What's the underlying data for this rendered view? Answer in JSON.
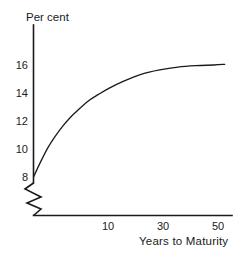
{
  "chart_data": {
    "type": "line",
    "title": "",
    "subtitle": "",
    "xlabel": "Years to Maturity",
    "ylabel": "Per cent",
    "xlim": [
      0,
      55
    ],
    "ylim": [
      7.2,
      17.2
    ],
    "grid": false,
    "legend": null,
    "axis_break": {
      "present": true,
      "axis": "y",
      "note": "zigzag break at origin indicating suppressed zero"
    },
    "xticks": [
      10,
      30,
      50
    ],
    "xtick_labels": [
      "10",
      "30",
      "50"
    ],
    "yticks": [
      8,
      10,
      12,
      14,
      16
    ],
    "ytick_labels": [
      "8",
      "10",
      "12",
      "14",
      "16"
    ],
    "series": [
      {
        "name": "Yield curve",
        "color": "#1a1a1a",
        "x": [
          0,
          2,
          4,
          6,
          8,
          10,
          12,
          15,
          18,
          21,
          25,
          30,
          35,
          40,
          45,
          50,
          53
        ],
        "y": [
          8.0,
          9.1,
          10.1,
          10.9,
          11.6,
          12.2,
          12.7,
          13.4,
          13.9,
          14.35,
          14.85,
          15.35,
          15.65,
          15.85,
          15.95,
          16.0,
          16.05
        ]
      }
    ]
  },
  "labels": {
    "y_axis_title": "Per cent",
    "x_axis_title": "Years to Maturity"
  }
}
